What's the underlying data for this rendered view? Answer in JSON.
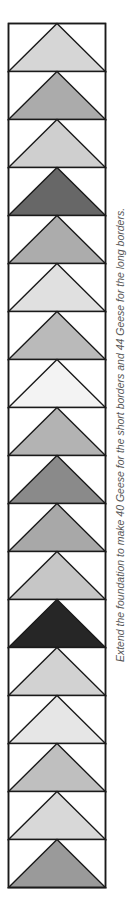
{
  "diagram": {
    "caption": "Extend the foundation to make 40 Geese for the short borders and 44 Geese for the long borders.",
    "background_color": "#ffffff",
    "line_color": "#1a1a1a",
    "geese_fills": [
      "#d6d6d6",
      "#ababab",
      "#cfcfcf",
      "#676767",
      "#acacac",
      "#e0e0e0",
      "#bababa",
      "#f3f3f3",
      "#b3b3b3",
      "#8a8a8a",
      "#a8a8a8",
      "#c6c6c6",
      "#262626",
      "#d2d2d2",
      "#e6e6e6",
      "#bfbfbf",
      "#d8d8d8",
      "#9a9a9a"
    ]
  }
}
